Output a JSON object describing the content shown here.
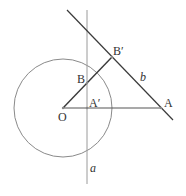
{
  "diagram": {
    "points": {
      "O": {
        "label": "O",
        "x": 63,
        "y": 108
      },
      "A": {
        "label": "A",
        "x": 161,
        "y": 108
      },
      "A_prime": {
        "label": "A′",
        "x": 87,
        "y": 108
      },
      "B": {
        "label": "B",
        "x": 87,
        "y": 83
      },
      "B_prime": {
        "label": "B′",
        "x": 112,
        "y": 57
      }
    },
    "lines": {
      "a": {
        "label": "a"
      },
      "b": {
        "label": "b"
      }
    },
    "circle": {
      "center": "O",
      "radius": 49
    },
    "colors": {
      "stroke_dark": "#444444",
      "stroke_light": "#888888"
    }
  }
}
